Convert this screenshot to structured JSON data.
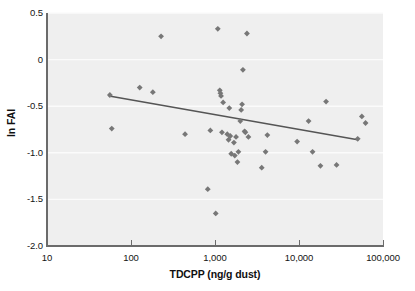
{
  "chart_data": {
    "type": "scatter",
    "title": "",
    "xlabel": "TDCPP (ng/g dust)",
    "ylabel": "ln FAI",
    "xscale": "log",
    "yscale": "linear",
    "xlim": [
      10,
      100000
    ],
    "ylim": [
      -2.0,
      0.5
    ],
    "grid": "horizontal",
    "legend": "none",
    "x_tick_labels": [
      "10",
      "100",
      "1,000",
      "10,000",
      "100,000"
    ],
    "x_tick_values": [
      10,
      100,
      1000,
      10000,
      100000
    ],
    "y_tick_labels": [
      "0.5",
      "0",
      "-0.5",
      "-1.0",
      "-1.5",
      "-2.0"
    ],
    "y_tick_values": [
      0.5,
      0,
      -0.5,
      -1.0,
      -1.5,
      -2.0
    ],
    "marker": "diamond",
    "marker_color": "#777777",
    "point_count": 45,
    "points": [
      {
        "x": 56,
        "y": -0.38
      },
      {
        "x": 59,
        "y": -0.74
      },
      {
        "x": 127,
        "y": -0.3
      },
      {
        "x": 182,
        "y": -0.35
      },
      {
        "x": 228,
        "y": 0.25
      },
      {
        "x": 440,
        "y": -0.8
      },
      {
        "x": 820,
        "y": -1.39
      },
      {
        "x": 880,
        "y": -0.76
      },
      {
        "x": 1020,
        "y": -1.65
      },
      {
        "x": 1080,
        "y": 0.33
      },
      {
        "x": 1140,
        "y": -0.33
      },
      {
        "x": 1160,
        "y": -0.36
      },
      {
        "x": 1180,
        "y": -0.39
      },
      {
        "x": 1210,
        "y": -0.78
      },
      {
        "x": 1250,
        "y": -0.46
      },
      {
        "x": 1400,
        "y": -0.8
      },
      {
        "x": 1450,
        "y": -0.86
      },
      {
        "x": 1480,
        "y": -0.52
      },
      {
        "x": 1520,
        "y": -0.82
      },
      {
        "x": 1560,
        "y": -1.01
      },
      {
        "x": 1680,
        "y": -0.89
      },
      {
        "x": 1720,
        "y": -1.03
      },
      {
        "x": 1780,
        "y": -0.83
      },
      {
        "x": 1850,
        "y": -1.1
      },
      {
        "x": 1900,
        "y": -0.99
      },
      {
        "x": 2000,
        "y": -0.66
      },
      {
        "x": 2050,
        "y": -0.54
      },
      {
        "x": 2100,
        "y": -0.48
      },
      {
        "x": 2150,
        "y": -0.11
      },
      {
        "x": 2250,
        "y": -0.77
      },
      {
        "x": 2400,
        "y": 0.28
      },
      {
        "x": 2500,
        "y": -0.83
      },
      {
        "x": 3600,
        "y": -1.16
      },
      {
        "x": 4000,
        "y": -0.99
      },
      {
        "x": 4200,
        "y": -0.81
      },
      {
        "x": 9500,
        "y": -0.88
      },
      {
        "x": 13000,
        "y": -0.66
      },
      {
        "x": 14500,
        "y": -0.99
      },
      {
        "x": 18000,
        "y": -1.14
      },
      {
        "x": 21000,
        "y": -0.45
      },
      {
        "x": 28000,
        "y": -1.13
      },
      {
        "x": 50000,
        "y": -0.85
      },
      {
        "x": 56000,
        "y": -0.61
      },
      {
        "x": 62000,
        "y": -0.68
      },
      {
        "x": 2300,
        "y": -0.78
      }
    ],
    "trend_line": {
      "color": "#555555",
      "x_start": 55,
      "y_start": -0.39,
      "x_end": 50000,
      "y_end": -0.86
    }
  },
  "axes": {
    "x_title": "TDCPP (ng/g dust)",
    "y_title": "ln FAI",
    "x_ticks": [
      {
        "label": "10",
        "value": 10
      },
      {
        "label": "100",
        "value": 100
      },
      {
        "label": "1,000",
        "value": 1000
      },
      {
        "label": "10,000",
        "value": 10000
      },
      {
        "label": "100,000",
        "value": 100000
      }
    ],
    "y_ticks": [
      {
        "label": "0.5",
        "value": 0.5
      },
      {
        "label": "0",
        "value": 0
      },
      {
        "label": "-0.5",
        "value": -0.5
      },
      {
        "label": "-1.0",
        "value": -1.0
      },
      {
        "label": "-1.5",
        "value": -1.5
      },
      {
        "label": "-2.0",
        "value": -2.0
      }
    ]
  },
  "style": {
    "plot_background": "#efefef",
    "gridline_color": "#fbfbfb",
    "axis_color": "#6b6b6b",
    "marker_color": "#777777",
    "trend_color": "#555555",
    "page_background": "#ffffff"
  }
}
